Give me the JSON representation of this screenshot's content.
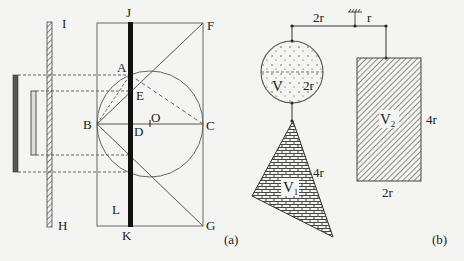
{
  "figure_a": {
    "caption": "(a)",
    "points": {
      "I": "I",
      "J": "J",
      "F": "F",
      "A": "A",
      "E": "E",
      "B": "B",
      "D": "D",
      "O": "O",
      "C": "C",
      "L": "L",
      "H": "H",
      "K": "K",
      "G": "G"
    }
  },
  "figure_b": {
    "caption": "(b)",
    "lever_left_arm": "2r",
    "lever_right_arm": "r",
    "sphere_label": "V",
    "sphere_diameter": "2r",
    "cone_label": "V",
    "cone_label_sub": "1",
    "cone_height": "4r",
    "cylinder_label": "V",
    "cylinder_label_sub": "2",
    "cylinder_height": "4r",
    "cylinder_width": "2r"
  }
}
